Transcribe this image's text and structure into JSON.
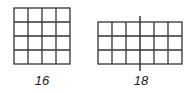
{
  "figures": [
    {
      "id": "square-grid",
      "rows": 4,
      "cols": 4,
      "label": "16",
      "description": "4 by 4 grid of unit squares"
    },
    {
      "id": "rect-grid",
      "rows": 3,
      "cols": 6,
      "label": "18",
      "description": "3 by 6 grid of unit squares with a vertical midline extending beyond the rectangle"
    }
  ],
  "colors": {
    "line": "#333333",
    "background": "#ffffff",
    "text": "#222222"
  }
}
